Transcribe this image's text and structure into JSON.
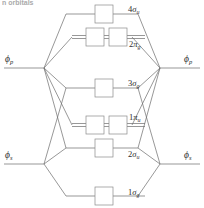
{
  "figure": {
    "caption_fragment": "n orbitals",
    "type": "molecular-orbital-correlation-diagram"
  },
  "atomic_orbitals": {
    "left": [
      {
        "id": "phi-p-left",
        "label": "ϕ",
        "sub": "p",
        "side": "left",
        "level": "p"
      },
      {
        "id": "phi-s-left",
        "label": "ϕ",
        "sub": "s",
        "side": "left",
        "level": "s"
      }
    ],
    "right": [
      {
        "id": "phi-p-right",
        "label": "ϕ",
        "sub": "p",
        "side": "right",
        "level": "p"
      },
      {
        "id": "phi-s-right",
        "label": "ϕ",
        "sub": "s",
        "side": "right",
        "level": "s"
      }
    ]
  },
  "molecular_orbitals": [
    {
      "id": "mo-4sigma-u",
      "number": "4",
      "symbol": "σ",
      "sub": "u",
      "text": "4σu",
      "degeneracy": 1,
      "boxes": 1,
      "double_line": false
    },
    {
      "id": "mo-2pi-g",
      "number": "2",
      "symbol": "π",
      "sub": "g",
      "text": "2πg",
      "degeneracy": 2,
      "boxes": 2,
      "double_line": true
    },
    {
      "id": "mo-3sigma-g",
      "number": "3",
      "symbol": "σ",
      "sub": "g",
      "text": "3σg",
      "degeneracy": 1,
      "boxes": 1,
      "double_line": false
    },
    {
      "id": "mo-1pi-u",
      "number": "1",
      "symbol": "π",
      "sub": "u",
      "text": "1πu",
      "degeneracy": 2,
      "boxes": 2,
      "double_line": true
    },
    {
      "id": "mo-2sigma-u",
      "number": "2",
      "symbol": "σ",
      "sub": "u",
      "text": "2σu",
      "degeneracy": 1,
      "boxes": 1,
      "double_line": false
    },
    {
      "id": "mo-1sigma-g",
      "number": "1",
      "symbol": "σ",
      "sub": "g",
      "text": "1σg",
      "degeneracy": 1,
      "boxes": 1,
      "double_line": false
    }
  ],
  "colors": {
    "line": "#6b6b6b",
    "box_stroke": "#8a8a8a",
    "box_fill": "#ffffff",
    "text": "#2b2b2b",
    "background": "#ffffff"
  }
}
